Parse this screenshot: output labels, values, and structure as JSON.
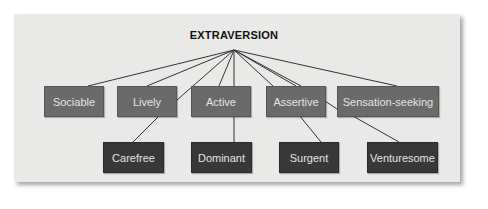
{
  "diagram": {
    "title": "EXTRAVERSION",
    "colors": {
      "panel": "#e9e9e7",
      "top_row_box": "#6a6a6a",
      "bottom_row_box": "#383838",
      "box_text": "#e4e4e4",
      "lines": "#333333"
    },
    "top_row": [
      {
        "label": "Sociable"
      },
      {
        "label": "Lively"
      },
      {
        "label": "Active"
      },
      {
        "label": "Assertive"
      },
      {
        "label": "Sensation-seeking"
      }
    ],
    "bottom_row": [
      {
        "label": "Carefree"
      },
      {
        "label": "Dominant"
      },
      {
        "label": "Surgent"
      },
      {
        "label": "Venturesome"
      }
    ]
  }
}
